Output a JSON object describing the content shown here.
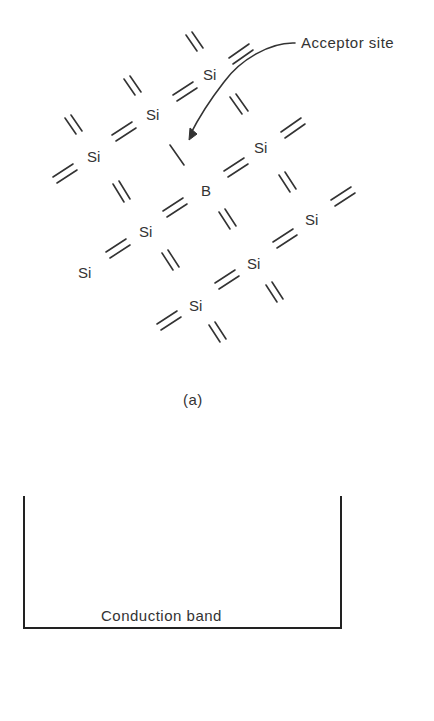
{
  "figure": {
    "panel_a": {
      "label": "(a)",
      "annotation": "Acceptor site",
      "atoms": [
        {
          "symbol": "Si",
          "x": 203,
          "y": 80
        },
        {
          "symbol": "Si",
          "x": 146,
          "y": 120
        },
        {
          "symbol": "Si",
          "x": 87,
          "y": 162
        },
        {
          "symbol": "Si",
          "x": 254,
          "y": 153
        },
        {
          "symbol": "B",
          "x": 201,
          "y": 196
        },
        {
          "symbol": "Si",
          "x": 139,
          "y": 237
        },
        {
          "symbol": "Si",
          "x": 78,
          "y": 278
        },
        {
          "symbol": "Si",
          "x": 305,
          "y": 225
        },
        {
          "symbol": "Si",
          "x": 247,
          "y": 269
        },
        {
          "symbol": "Si",
          "x": 189,
          "y": 311
        }
      ]
    },
    "panel_b": {
      "band_label": "Conduction band"
    }
  }
}
